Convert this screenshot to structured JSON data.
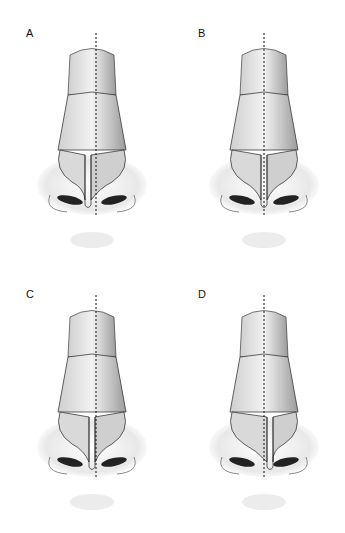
{
  "figure": {
    "panels": [
      {
        "label": "A",
        "midline_offset": 4,
        "septum_shift": -4
      },
      {
        "label": "B",
        "midline_offset": 0,
        "septum_shift": 0
      },
      {
        "label": "C",
        "midline_offset": 4,
        "septum_shift": 0
      },
      {
        "label": "D",
        "midline_offset": 0,
        "septum_shift": 6
      }
    ],
    "colors": {
      "background": "#ffffff",
      "line": "#222222",
      "shade": "#9a9a9a",
      "light": "#e6e6e6"
    }
  }
}
